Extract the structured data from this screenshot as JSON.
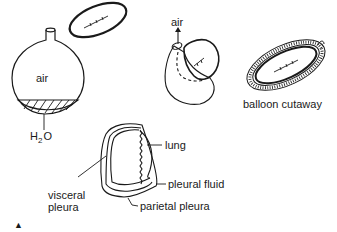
{
  "figure": {
    "panels": [
      {
        "id": "flask",
        "labels": {
          "air": "air",
          "water_main": "H",
          "water_sub": "2",
          "water_end": "O"
        }
      },
      {
        "id": "balloon-push",
        "labels": {
          "air": "air"
        }
      },
      {
        "id": "balloon-cutaway",
        "labels": {
          "caption": "balloon cutaway"
        }
      },
      {
        "id": "lung-pleura",
        "labels": {
          "lung": "lung",
          "pleural_fluid": "pleural fluid",
          "parietal_pleura": "parietal pleura",
          "visceral_line1": "visceral",
          "visceral_line2": "pleura"
        }
      }
    ],
    "marker": "▲",
    "colors": {
      "ink": "#1a1a1a",
      "background": "#ffffff"
    }
  }
}
